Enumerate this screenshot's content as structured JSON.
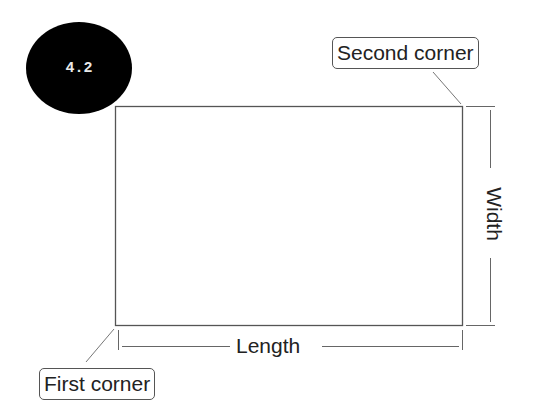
{
  "figure": {
    "badge": "4.2",
    "callouts": {
      "first_corner": "First corner",
      "second_corner": "Second corner"
    },
    "dimensions": {
      "length": "Length",
      "width": "Width"
    },
    "colors": {
      "badge_bg": "#000000",
      "badge_text": "#e8e8e8",
      "line": "#555555"
    }
  }
}
